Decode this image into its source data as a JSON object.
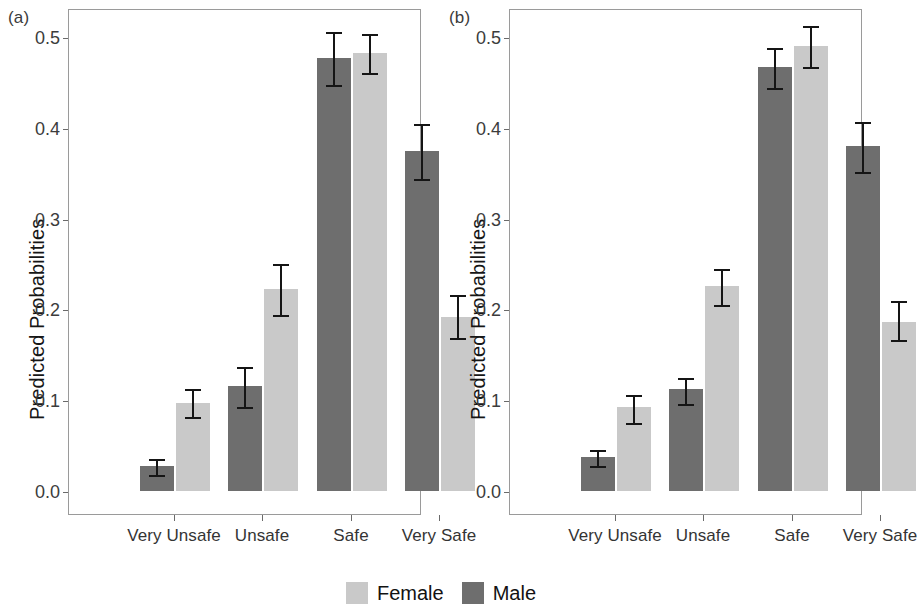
{
  "figure": {
    "panel_a_label": "(a)",
    "panel_b_label": "(b)",
    "ylabel": "Predicted Probabilities",
    "ytick_labels": [
      "0.0",
      "0.1",
      "0.2",
      "0.3",
      "0.4",
      "0.5"
    ],
    "xtick_labels": [
      "Very Unsafe",
      "Unsafe",
      "Safe",
      "Very Safe"
    ],
    "legend": {
      "female_label": "Female",
      "male_label": "Male",
      "female_color": "#c9c9c9",
      "male_color": "#6e6e6e"
    }
  },
  "chart_data": [
    {
      "type": "bar",
      "panel": "(a)",
      "title": "",
      "xlabel": "",
      "ylabel": "Predicted Probabilities",
      "ylim": [
        0.0,
        0.55
      ],
      "yticks": [
        0.0,
        0.1,
        0.2,
        0.3,
        0.4,
        0.5
      ],
      "grid": false,
      "legend_position": "bottom-center",
      "categories": [
        "Very Unsafe",
        "Unsafe",
        "Safe",
        "Very Safe"
      ],
      "series": [
        {
          "name": "Male",
          "color": "#6e6e6e",
          "values": [
            0.027,
            0.116,
            0.477,
            0.375
          ],
          "err_low": [
            0.018,
            0.093,
            0.447,
            0.344
          ],
          "err_high": [
            0.037,
            0.139,
            0.508,
            0.406
          ]
        },
        {
          "name": "Female",
          "color": "#c9c9c9",
          "values": [
            0.097,
            0.222,
            0.482,
            0.192
          ],
          "err_low": [
            0.081,
            0.194,
            0.46,
            0.168
          ],
          "err_high": [
            0.115,
            0.252,
            0.506,
            0.218
          ]
        }
      ]
    },
    {
      "type": "bar",
      "panel": "(b)",
      "title": "",
      "xlabel": "",
      "ylabel": "Predicted Probabilities",
      "ylim": [
        0.0,
        0.55
      ],
      "yticks": [
        0.0,
        0.1,
        0.2,
        0.3,
        0.4,
        0.5
      ],
      "grid": false,
      "legend_position": "bottom-center",
      "categories": [
        "Very Unsafe",
        "Unsafe",
        "Safe",
        "Very Safe"
      ],
      "series": [
        {
          "name": "Male",
          "color": "#6e6e6e",
          "values": [
            0.037,
            0.112,
            0.467,
            0.38
          ],
          "err_low": [
            0.028,
            0.096,
            0.444,
            0.351
          ],
          "err_high": [
            0.047,
            0.127,
            0.49,
            0.409
          ]
        },
        {
          "name": "Female",
          "color": "#c9c9c9",
          "values": [
            0.092,
            0.226,
            0.49,
            0.186
          ],
          "err_low": [
            0.075,
            0.205,
            0.467,
            0.166
          ],
          "err_high": [
            0.108,
            0.247,
            0.514,
            0.212
          ]
        }
      ]
    }
  ]
}
